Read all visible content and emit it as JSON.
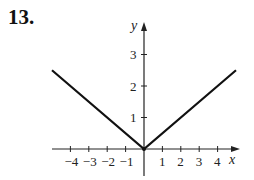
{
  "problem": {
    "number": "13."
  },
  "chart_data": {
    "type": "line",
    "title": "",
    "xlabel": "x",
    "ylabel": "y",
    "x_ticks": [
      -4,
      -3,
      -2,
      -1,
      1,
      2,
      3,
      4
    ],
    "x_tick_labels": [
      "−4",
      "−3",
      "−2",
      "−1",
      "1",
      "2",
      "3",
      "4"
    ],
    "y_ticks": [
      1,
      2,
      3
    ],
    "y_tick_labels": [
      "1",
      "2",
      "3"
    ],
    "xlim": [
      -5,
      5
    ],
    "ylim": [
      -1,
      3.8
    ],
    "grid": false,
    "legend": null,
    "series": [
      {
        "name": "y = |x|/2",
        "x": [
          -5,
          0,
          5
        ],
        "y": [
          2.5,
          0,
          2.5
        ],
        "color": "#111111"
      }
    ]
  }
}
